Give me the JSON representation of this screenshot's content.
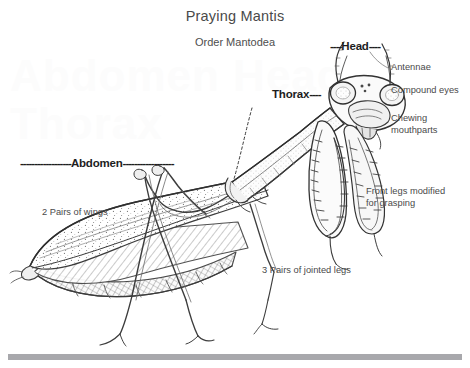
{
  "diagram": {
    "title": "Praying Mantis",
    "subtitle": "Order Mantodea",
    "part_labels": {
      "head": "Head",
      "head_dash_left": "----",
      "head_dash_right": "----",
      "thorax": "Thorax",
      "thorax_dash_right": "----",
      "abdomen": "Abdomen",
      "abdomen_dash_left": "------------------",
      "abdomen_dash_right": "------------------"
    },
    "annotations": {
      "antennae": "Antennae",
      "compound_eyes": "Compound eyes",
      "chewing_mouthparts": "Chewing\nmouthparts",
      "front_legs": "Front legs modified\nfor grasping",
      "wings": "2 Pairs of wings",
      "jointed_legs": "3 Pairs of jointed legs"
    },
    "watermark": "Abdomen Head Thorax",
    "colors": {
      "ink": "#3a3a3a",
      "label_bold": "#1d1d1d",
      "rule": "#a8a8ac",
      "background": "#ffffff"
    }
  }
}
